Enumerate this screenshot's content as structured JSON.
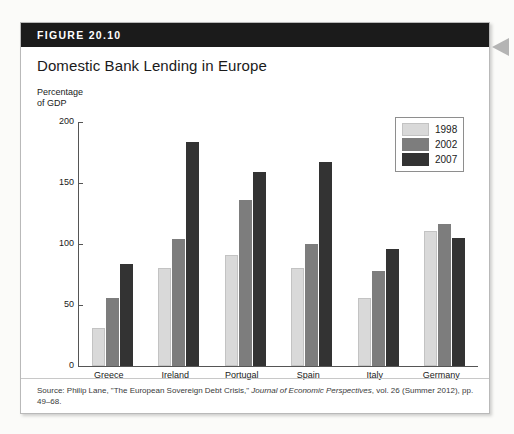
{
  "figure": {
    "number_label": "FIGURE 20.10",
    "title": "Domestic Bank Lending in Europe",
    "axis_caption": "Percentage\nof GDP",
    "source": "Source: Philip Lane, \"The European Sovereign Debt Crisis,\" Journal of Economic Perspectives, vol. 26 (Summer 2012), pp. 49–68.",
    "source_parts": {
      "lead": "Source: Philip Lane, \"The European Sovereign Debt Crisis,\" ",
      "italic": "Journal of Economic Perspectives",
      "tail": ", vol. 26 (Summer 2012), pp. 49–68."
    }
  },
  "colors": {
    "header_bar": "#1b1b1b",
    "series_1998": "#d9d9d9",
    "series_2002": "#7d7d7d",
    "series_2007": "#333333",
    "page_background": "#fbfbf9",
    "card_background": "#ffffff",
    "pointer_arrow": "#b4b4b4"
  },
  "legend": {
    "entries": [
      {
        "label": "1998",
        "swatch_class": "y1998"
      },
      {
        "label": "2002",
        "swatch_class": "y2002"
      },
      {
        "label": "2007",
        "swatch_class": "y2007"
      }
    ]
  },
  "chart_data": {
    "type": "bar",
    "title": "Domestic Bank Lending in Europe",
    "xlabel": "",
    "ylabel": "Percentage of GDP",
    "ylim": [
      0,
      200
    ],
    "yticks": [
      0,
      50,
      100,
      150,
      200
    ],
    "ytick_labels": [
      "0",
      "50",
      "100",
      "150",
      "200"
    ],
    "grid": false,
    "legend_position": "top-right-inside",
    "categories": [
      "Greece",
      "Ireland",
      "Portugal",
      "Spain",
      "Italy",
      "Germany"
    ],
    "series": [
      {
        "name": "1998",
        "color": "#d9d9d9",
        "values": [
          31,
          80,
          91,
          80,
          56,
          111
        ]
      },
      {
        "name": "2002",
        "color": "#7d7d7d",
        "values": [
          56,
          104,
          136,
          100,
          78,
          116
        ]
      },
      {
        "name": "2007",
        "color": "#333333",
        "values": [
          84,
          184,
          159,
          167,
          96,
          105
        ]
      }
    ]
  }
}
